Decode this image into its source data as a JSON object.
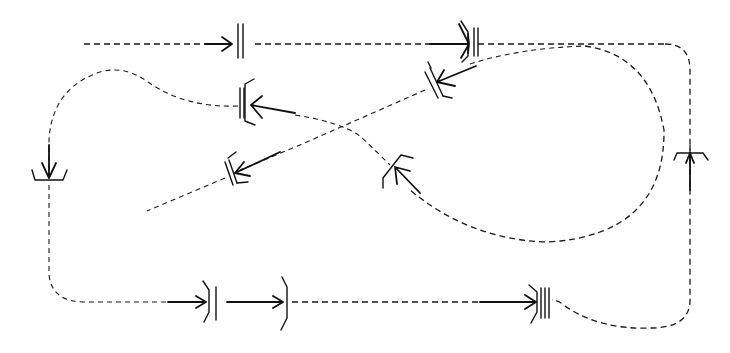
{
  "diagram": {
    "background": "#ffffff",
    "stroke_color": "#1a1a1a",
    "paths": [
      {
        "id": "top-line",
        "style": "dashed",
        "d": "M84,44 L690,44"
      },
      {
        "id": "right-loop",
        "style": "dashed",
        "d": "M665,44 Q690,44 690,70 L690,300 Q690,328 650,328 Q600,330 565,298"
      },
      {
        "id": "big-curve",
        "style": "dashed",
        "d": "M555,44 Q650,50 665,130 Q660,235 545,243 Q470,240 398,175"
      },
      {
        "id": "s-curve",
        "style": "dashed",
        "d": "M250,102 Q330,108 360,125 Q370,140 393,160"
      },
      {
        "id": "left-loop",
        "style": "dashed",
        "d": "M250,102 Q180,95 150,80 Q120,60 95,70 Q50,90 49,140 L49,275 Q49,302 80,302 L205,302"
      },
      {
        "id": "diagonal",
        "style": "dashed",
        "d": "M147,211 L555,44"
      },
      {
        "id": "bottom-line",
        "style": "dashed",
        "d": "M290,302 L540,302"
      }
    ],
    "connectors": [
      {
        "id": "conn-top-1",
        "type": "double-bar-arrow-in",
        "x": 237,
        "y": 44
      },
      {
        "id": "conn-top-2",
        "type": "bracket-double-bar",
        "x": 470,
        "y": 44
      },
      {
        "id": "conn-diag-1",
        "type": "bracket-double-bar-rotated",
        "x": 433,
        "y": 84
      },
      {
        "id": "conn-mid-left",
        "type": "bracket-double-bar-left",
        "x": 243,
        "y": 102
      },
      {
        "id": "conn-diag-2",
        "type": "bracket-double-bar-rotated",
        "x": 230,
        "y": 173
      },
      {
        "id": "conn-mid-right",
        "type": "bracket-rotated",
        "x": 393,
        "y": 170
      },
      {
        "id": "conn-left",
        "type": "tray-down",
        "x": 49,
        "y": 177
      },
      {
        "id": "conn-right",
        "type": "tray-up",
        "x": 690,
        "y": 153
      },
      {
        "id": "conn-bottom-1",
        "type": "bracket-bar",
        "x": 208,
        "y": 302
      },
      {
        "id": "conn-bottom-2",
        "type": "bracket",
        "x": 285,
        "y": 302
      },
      {
        "id": "conn-bottom-3",
        "type": "bracket-triple-bar",
        "x": 540,
        "y": 302
      }
    ]
  }
}
